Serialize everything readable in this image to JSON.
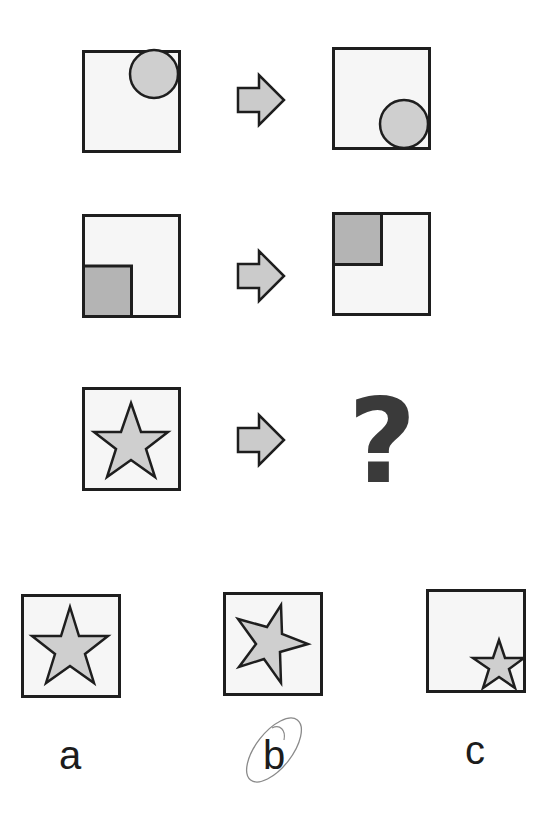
{
  "puzzle": {
    "colors": {
      "stroke": "#1e1e1e",
      "box_fill": "#f6f6f6",
      "shape_fill": "#cfcfcf",
      "square_fill": "#b4b4b4",
      "arrow_fill": "#cbcbcb",
      "question_mark": "#3a3a3a",
      "circle_mark": "#8a8a8a"
    },
    "rows": [
      {
        "left": "circle-top-right",
        "arrow": "arrow-right",
        "right": "circle-bottom-right"
      },
      {
        "left": "square-bottom-left",
        "arrow": "arrow-right",
        "right": "square-top-left"
      },
      {
        "left": "star-centered",
        "arrow": "arrow-right",
        "right": "?"
      }
    ],
    "question_mark": "?",
    "options": [
      {
        "label": "a",
        "content": "star-centered-upright"
      },
      {
        "label": "b",
        "content": "star-rotated",
        "circled": true
      },
      {
        "label": "c",
        "content": "small-star-bottom-right"
      }
    ]
  }
}
